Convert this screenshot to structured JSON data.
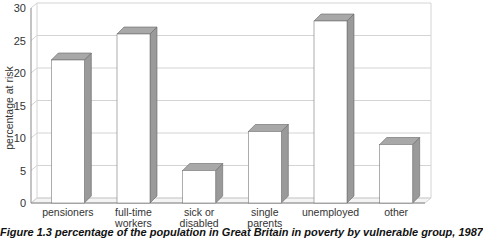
{
  "chart_data": {
    "type": "bar",
    "style": "3d",
    "title": "",
    "xlabel": "",
    "ylabel": "percentage at risk",
    "ylim": [
      0,
      30
    ],
    "yticks": [
      0,
      5,
      10,
      15,
      20,
      25,
      30
    ],
    "grid": true,
    "legend": null,
    "categories": [
      "pensioners",
      "full-time workers",
      "sick or disabled",
      "single parents",
      "unemployed",
      "other"
    ],
    "category_lines": [
      [
        "pensioners"
      ],
      [
        "full-time",
        "workers"
      ],
      [
        "sick or",
        "disabled"
      ],
      [
        "single",
        "parents"
      ],
      [
        "unemployed"
      ],
      [
        "other"
      ]
    ],
    "values": [
      22,
      26,
      5,
      11,
      28,
      9
    ],
    "colors": {
      "front": "#ffffff",
      "side": "#9a9a9a",
      "top": "#a8a8a8",
      "grid": "#d4d4d4",
      "axis": "#888888"
    }
  },
  "caption": "Figure 1.3 percentage of the population in Great Britain in poverty by vulnerable group, 1987"
}
